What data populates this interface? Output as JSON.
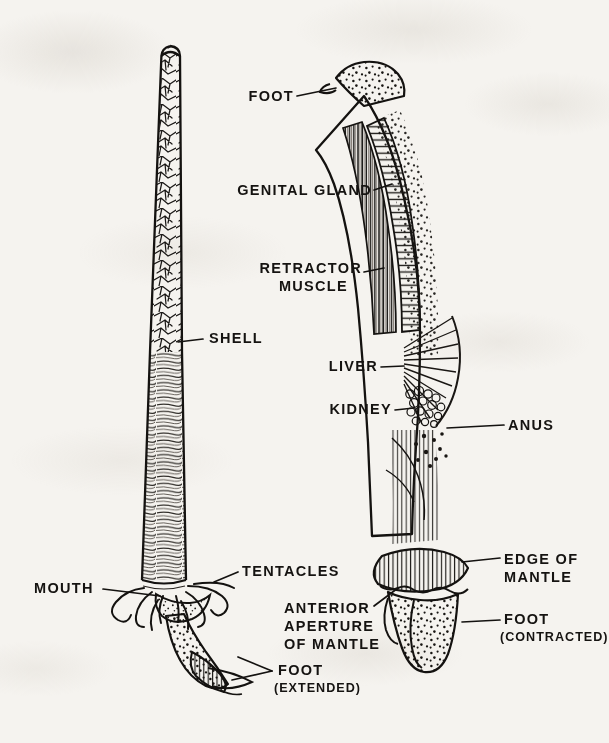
{
  "figure": {
    "ink_color": "#151311",
    "paper_color": "#f5f3ef"
  },
  "labels": {
    "foot": "FOOT",
    "genital_gland": "GENITAL GLAND",
    "retractor_muscle_line1": "RETRACTOR",
    "retractor_muscle_line2": "MUSCLE",
    "shell": "SHELL",
    "liver": "LIVER",
    "kidney": "KIDNEY",
    "anus": "ANUS",
    "edge_of_mantle_line1": "EDGE OF",
    "edge_of_mantle_line2": "MANTLE",
    "foot_contracted_line1": "FOOT",
    "foot_contracted_line2": "(CONTRACTED)",
    "mouth": "MOUTH",
    "tentacles": "TENTACLES",
    "anterior_aperture_line1": "ANTERIOR",
    "anterior_aperture_line2": "APERTURE",
    "anterior_aperture_line3": "OF MANTLE",
    "foot_extended_line1": "FOOT",
    "foot_extended_line2": "(EXTENDED)"
  }
}
